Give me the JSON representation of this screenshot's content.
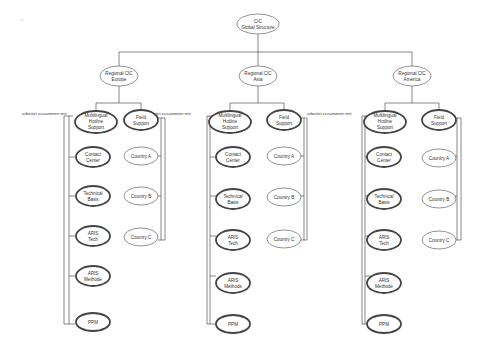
{
  "diagram": {
    "root": {
      "lines": [
        "CIC",
        "Global Structure"
      ]
    },
    "relation_label": "arbeitet zusammen mit",
    "regions": [
      {
        "name": "Europe",
        "node": {
          "lines": [
            "Regional CIC",
            "Europe"
          ]
        },
        "hotline": {
          "lines": [
            "Multilingual",
            "Hotline",
            "Support"
          ]
        },
        "field": {
          "lines": [
            "Field",
            "Support"
          ]
        },
        "hotline_children": [
          {
            "lines": [
              "Contact",
              "Center"
            ]
          },
          {
            "lines": [
              "Technical",
              "Basis"
            ]
          },
          {
            "lines": [
              "ARIS",
              "Tech"
            ]
          },
          {
            "lines": [
              "ARIS",
              "Methode"
            ]
          },
          {
            "lines": [
              "PPM"
            ]
          }
        ],
        "field_children": [
          {
            "lines": [
              "Country A"
            ]
          },
          {
            "lines": [
              "Country B"
            ]
          },
          {
            "lines": [
              "Country C"
            ]
          }
        ]
      },
      {
        "name": "Asia",
        "node": {
          "lines": [
            "Regional CIC",
            "Asia"
          ]
        },
        "hotline": {
          "lines": [
            "Multilingual",
            "Hotline",
            "Support"
          ]
        },
        "field": {
          "lines": [
            "Field",
            "Support"
          ]
        },
        "hotline_children": [
          {
            "lines": [
              "Contact",
              "Center"
            ]
          },
          {
            "lines": [
              "Technical",
              "Basis"
            ]
          },
          {
            "lines": [
              "ARIS",
              "Tech"
            ]
          },
          {
            "lines": [
              "ARIS",
              "Methods"
            ]
          },
          {
            "lines": [
              "PPM"
            ]
          }
        ],
        "field_children": [
          {
            "lines": [
              "Country A"
            ]
          },
          {
            "lines": [
              "Country B"
            ]
          },
          {
            "lines": [
              "Country C"
            ]
          }
        ]
      },
      {
        "name": "America",
        "node": {
          "lines": [
            "Regional CIC",
            "America"
          ]
        },
        "hotline": {
          "lines": [
            "Multilingual",
            "Hotline",
            "Support"
          ]
        },
        "field": {
          "lines": [
            "Field",
            "Support"
          ]
        },
        "hotline_children": [
          {
            "lines": [
              "Contact",
              "Center"
            ]
          },
          {
            "lines": [
              "Technical",
              "Basis"
            ]
          },
          {
            "lines": [
              "ARIS",
              "Tech"
            ]
          },
          {
            "lines": [
              "ARIS",
              "Methode"
            ]
          },
          {
            "lines": [
              "PPM"
            ]
          }
        ],
        "field_children": [
          {
            "lines": [
              "Country A"
            ]
          },
          {
            "lines": [
              "Country B"
            ]
          },
          {
            "lines": [
              "Country C"
            ]
          }
        ]
      }
    ]
  }
}
